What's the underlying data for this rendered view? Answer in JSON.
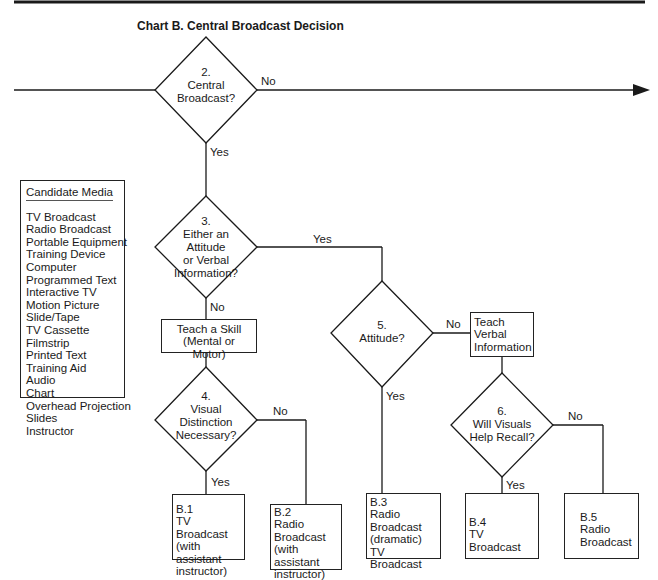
{
  "title": "Chart B. Central Broadcast Decision",
  "candidate_media": {
    "header": "Candidate Media",
    "items": [
      "TV Broadcast",
      "Radio Broadcast",
      "Portable Equipment",
      "Training Device",
      "Computer",
      "Programmed Text",
      "Interactive TV",
      "Motion Picture",
      "Slide/Tape",
      "TV Cassette",
      "Filmstrip",
      "Printed Text",
      "Training Aid",
      "Audio",
      "Chart",
      "Overhead Projection",
      "Slides",
      "Instructor"
    ]
  },
  "decisions": {
    "d2": {
      "num": "2.",
      "l1": "Central",
      "l2": "Broadcast?"
    },
    "d3": {
      "num": "3.",
      "l1": "Either an",
      "l2": "Attitude",
      "l3": "or Verbal",
      "l4": "Information?"
    },
    "d4": {
      "num": "4.",
      "l1": "Visual",
      "l2": "Distinction",
      "l3": "Necessary?"
    },
    "d5": {
      "num": "5.",
      "l1": "Attitude?"
    },
    "d6": {
      "num": "6.",
      "l1": "Will Visuals",
      "l2": "Help Recall?"
    }
  },
  "process": {
    "skill": {
      "l1": "Teach a Skill",
      "l2": "(Mental or Motor)"
    },
    "verbal": {
      "l1": "Teach",
      "l2": "Verbal",
      "l3": "Information"
    }
  },
  "outcomes": {
    "b1": {
      "l1": "B.1",
      "l2": "TV Broadcast",
      "l3": "(with assistant",
      "l4": "instructor)"
    },
    "b2": {
      "l1": "B.2",
      "l2": "Radio",
      "l3": "Broadcast",
      "l4": "(with assistant",
      "l5": "instructor)"
    },
    "b3": {
      "l1": "B.3",
      "l2": "Radio",
      "l3": "Broadcast",
      "l4": "(dramatic)",
      "l5": "TV Broadcast"
    },
    "b4": {
      "l1": "B.4",
      "l2": "TV Broadcast"
    },
    "b5": {
      "l1": "B.5",
      "l2": "Radio",
      "l3": "Broadcast"
    }
  },
  "edge_labels": {
    "yes": "Yes",
    "no": "No"
  }
}
